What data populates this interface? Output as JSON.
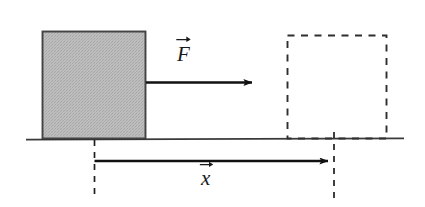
{
  "figure": {
    "background_color": "#ffffff",
    "stroke_color": "#1a1a1a",
    "ground": {
      "name": "ground-line",
      "x1": 26,
      "y1": 139,
      "x2": 404,
      "y2": 139
    },
    "block_initial": {
      "name": "block-initial-position",
      "x": 42,
      "y": 31,
      "width": 104,
      "height": 108,
      "fill_color": "#b9b9b9",
      "stroke_color": "#2b2b2b",
      "style": "solid-filled"
    },
    "block_final": {
      "name": "block-final-position",
      "x": 287,
      "y": 35,
      "width": 100,
      "height": 104,
      "fill_color": "none",
      "stroke_color": "#2b2b2b",
      "style": "dashed-outline"
    },
    "force_arrow": {
      "name": "force-arrow",
      "x1": 146,
      "y1": 82,
      "x2": 258,
      "y2": 82,
      "label": "F",
      "label_accent": "vector-arrow"
    },
    "displacement_arrow": {
      "name": "displacement-arrow",
      "x1": 94,
      "y1": 161,
      "x2": 334,
      "y2": 161,
      "label": "x",
      "label_accent": "vector-arrow"
    },
    "reference_line_start": {
      "name": "reference-line-start",
      "x": 94,
      "y1": 140,
      "y2": 200,
      "style": "dashed"
    },
    "reference_line_end": {
      "name": "reference-line-end",
      "x": 334,
      "y1": 132,
      "y2": 200,
      "style": "dashed"
    }
  }
}
